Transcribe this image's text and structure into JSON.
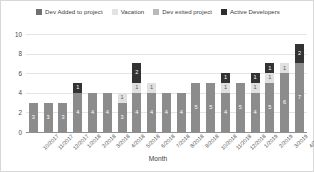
{
  "chart_data": {
    "type": "bar",
    "stacked": true,
    "title": "",
    "xlabel": "Month",
    "ylabel": "",
    "ylim": [
      0,
      10
    ],
    "yticks": [
      0,
      2,
      4,
      6,
      8,
      10
    ],
    "grid": true,
    "legend_position": "top",
    "categories": [
      "10/2017",
      "11/2017",
      "12/2017",
      "1/2018",
      "2/2018",
      "3/2018",
      "4/2018",
      "5/2018",
      "6/2018",
      "7/2018",
      "8/2018",
      "9/2018",
      "10/2018",
      "11/2018",
      "12/2018",
      "1/2019",
      "2/2019",
      "3/2019",
      "4/2019"
    ],
    "series": [
      {
        "name": "Active Developers",
        "color": "#8c8c8c",
        "values": [
          3,
          3,
          3,
          4,
          4,
          4,
          3,
          4,
          4,
          4,
          4,
          5,
          5,
          4,
          5,
          4,
          5,
          6,
          7
        ]
      },
      {
        "name": "Vacation",
        "color": "#e0e0e0",
        "values": [
          0,
          0,
          0,
          0,
          0,
          0,
          1,
          1,
          1,
          0,
          0,
          0,
          0,
          1,
          0,
          1,
          1,
          1,
          0
        ]
      },
      {
        "name": "Dev exited project",
        "color": "#b2b2b2",
        "values": [
          0,
          0,
          0,
          0,
          0,
          0,
          0,
          0,
          0,
          0,
          0,
          0,
          0,
          0,
          0,
          0,
          0,
          0,
          0
        ]
      },
      {
        "name": "Dev Added to project",
        "color": "#333333",
        "values": [
          0,
          0,
          0,
          1,
          0,
          0,
          0,
          2,
          0,
          0,
          0,
          0,
          0,
          1,
          0,
          1,
          1,
          0,
          2
        ]
      }
    ]
  },
  "legend": {
    "items": [
      {
        "label": "Dev Added to project",
        "color": "#707070"
      },
      {
        "label": "Vacation",
        "color": "#e3e3e3"
      },
      {
        "label": "Dev exited project",
        "color": "#b9b9b9"
      },
      {
        "label": "Active Developers",
        "color": "#2e2e2e"
      }
    ]
  }
}
